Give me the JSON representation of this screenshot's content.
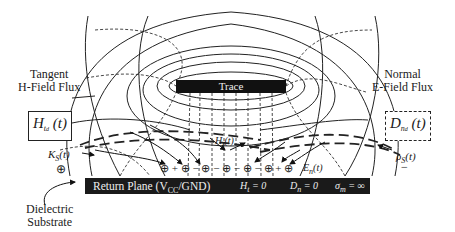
{
  "diagram": {
    "trace_label": "Trace",
    "return_plane_label": "Return Plane (V",
    "return_plane_sub": "CC",
    "return_plane_suffix": "/GND)",
    "plane_conditions": {
      "h_tangent": "H",
      "h_tangent_sub": "t",
      "h_tangent_eq": "= 0",
      "d_normal": "D",
      "d_normal_sub": "n",
      "d_normal_eq": "= 0",
      "sigma": "σ",
      "sigma_sub": "m",
      "sigma_eq": "= ∞"
    },
    "left_callout": {
      "line1": "Tangent",
      "line2": "H-Field Flux",
      "symbol": "H",
      "symbol_sub": "t",
      "symbol_subsub": "d",
      "symbol_arg": "(t)"
    },
    "right_callout": {
      "line1": "Normal",
      "line2": "E-Field Flux",
      "symbol": "D",
      "symbol_sub": "n",
      "symbol_subsub": "d",
      "symbol_arg": "(t)"
    },
    "surface_current": {
      "symbol": "K",
      "sub": "S",
      "arg": "(t)",
      "marker": "⊕"
    },
    "surface_charge": {
      "symbol": "ρ",
      "sub": "S",
      "arg": "(t)",
      "marker": "−"
    },
    "inner_h_label": {
      "symbol": "H",
      "sub": "t",
      "arg": "(t)"
    },
    "inner_e_label": {
      "symbol": "E",
      "sub": "n",
      "arg": "(t)"
    },
    "charge_row": "⊕ + ⊕ − ⊕ − ⊕ − ⊕ − ⊕ + ⊕",
    "substrate_label": {
      "line1": "Dielectric",
      "line2": "Substrate"
    }
  }
}
